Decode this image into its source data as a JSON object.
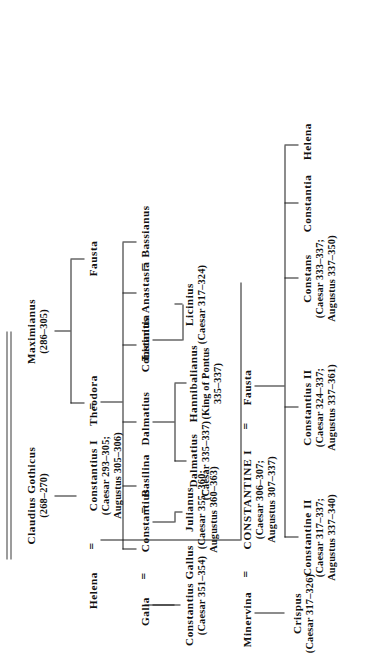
{
  "chart_title": "Constantinian dynasty family tree",
  "chart_type": "genealogy-tree",
  "orientation": "rotated-90-ccw",
  "people": {
    "claudius_gothicus": {
      "name": "Claudius Gothicus",
      "dates": "(268–270)"
    },
    "maximianus": {
      "name": "Maximianus",
      "dates": "(286–305)"
    },
    "helena": {
      "name": "Helena"
    },
    "constantius_i": {
      "name": "Constantius I",
      "dates_1": "(Caesar 293–305;",
      "dates_2": "Augustus 305–306)"
    },
    "theodora": {
      "name": "Theodora"
    },
    "fausta_top": {
      "name": "Fausta"
    },
    "galla": {
      "name": "Galla"
    },
    "constantius": {
      "name": "Constantius"
    },
    "basilina": {
      "name": "Basilina"
    },
    "dalmatius_top": {
      "name": "Dalmatius"
    },
    "constantia": {
      "name": "Constantia"
    },
    "licinius_top": {
      "name": "Licinius"
    },
    "anastasia": {
      "name": "Anastasia"
    },
    "bassianus": {
      "name": "Bassianus"
    },
    "constantius_gallus": {
      "name": "Constantius Gallus",
      "dates": "(Caesar 351–354)"
    },
    "julianus": {
      "name": "Julianus",
      "dates_1": "(Caesar 355–360;",
      "dates_2": "Augustus 360–363)"
    },
    "dalmatius_caesar": {
      "name": "Dalmatius",
      "dates": "(Caesar 335–337)"
    },
    "hannibalianus": {
      "name": "Hannibalianus",
      "dates_1": "(King of Pontus",
      "dates_2": "335–337)"
    },
    "licinius_caesar": {
      "name": "Licinius",
      "dates": "(Caesar 317–324)"
    },
    "minervina": {
      "name": "Minervina"
    },
    "constantine_i": {
      "name": "CONSTANTINE I",
      "dates_1": "(Caesar 306–307;",
      "dates_2": "Augustus 307–337)"
    },
    "fausta_mid": {
      "name": "Fausta"
    },
    "crispus": {
      "name": "Crispus",
      "dates": "(Caesar 317–326)"
    },
    "constantine_ii": {
      "name": "Constantine II",
      "dates_1": "(Caesar 317–337;",
      "dates_2": "Augustus 337–340)"
    },
    "constantius_ii": {
      "name": "Constantius II",
      "dates_1": "(Caesar 324–337;",
      "dates_2": "Augustus 337–361)"
    },
    "constans": {
      "name": "Constans",
      "dates_1": "(Caesar 333–337;",
      "dates_2": "Augustus 337–350)"
    },
    "constantia_low": {
      "name": "Constantia"
    },
    "helena_low": {
      "name": "Helena"
    }
  },
  "marriage_symbol": "=",
  "colors": {
    "ink": "#111111",
    "rule": "#1a1a1a",
    "paper": "#ffffff"
  }
}
